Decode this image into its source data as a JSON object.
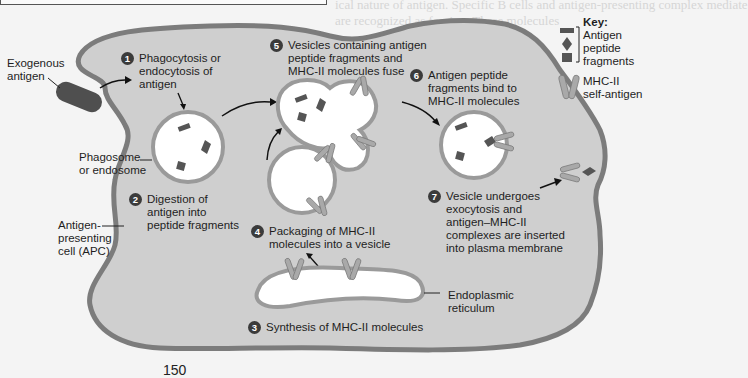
{
  "background": {
    "faded_text": [
      "ical nature of antigen. Specific B cells and antigen-presenting complex mediate",
      "are recognized as foreign. These molecules",
      "Pathways of Antigen Processing"
    ]
  },
  "labels": {
    "exogenous_antigen": [
      "Exogenous",
      "antigen"
    ],
    "phagosome": [
      "Phagosome",
      "or endosome"
    ],
    "apc": [
      "Antigen-",
      "presenting",
      "cell (APC)"
    ],
    "er": [
      "Endoplasmic",
      "reticulum"
    ]
  },
  "steps": [
    {
      "num": "1",
      "lines": [
        "Phagocytosis or",
        "endocytosis of",
        "antigen"
      ]
    },
    {
      "num": "2",
      "lines": [
        "Digestion of",
        "antigen into",
        "peptide fragments"
      ]
    },
    {
      "num": "3",
      "lines": [
        "Synthesis of MHC-II molecules"
      ]
    },
    {
      "num": "4",
      "lines": [
        "Packaging of MHC-II",
        "molecules into a vesicle"
      ]
    },
    {
      "num": "5",
      "lines": [
        "Vesicles containing antigen",
        "peptide fragments and",
        "MHC-II molecules fuse"
      ]
    },
    {
      "num": "6",
      "lines": [
        "Antigen peptide",
        "fragments bind to",
        "MHC-II molecules"
      ]
    },
    {
      "num": "7",
      "lines": [
        "Vesicle undergoes",
        "exocytosis and",
        "antigen–MHC-II",
        "complexes are inserted",
        "into plasma membrane"
      ]
    }
  ],
  "key": {
    "title": "Key:",
    "items": [
      {
        "icon": "antigen-peptide-fragments-icon",
        "lines": [
          "Antigen",
          "peptide",
          "fragments"
        ]
      },
      {
        "icon": "mhc-ii-icon",
        "lines": [
          "MHC-II",
          "self-antigen"
        ]
      }
    ]
  },
  "page_number": "150",
  "colors": {
    "cell_fill": "#cfcfcf",
    "membrane": "#7c7c7c",
    "vesicle_fill": "#ffffff",
    "antigen": "#5a5a5a",
    "mhc": "#a9a9a9",
    "number_badge": "#3b3b3b"
  }
}
